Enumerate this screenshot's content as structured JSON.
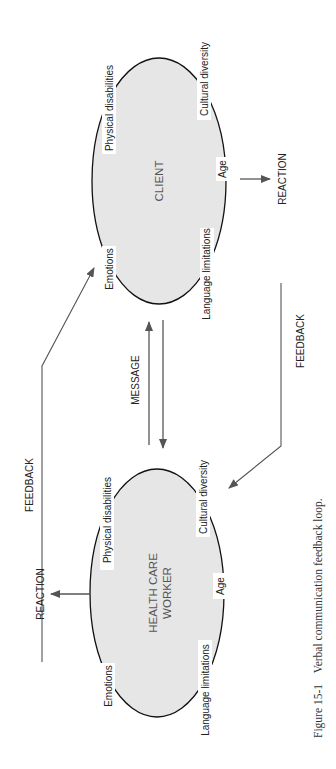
{
  "diagram": {
    "client": {
      "title": "CLIENT",
      "factors": {
        "physical": "Physical disabilities",
        "cultural": "Cultural diversity",
        "age": "Age",
        "emotions": "Emotions",
        "language": "Language limitations"
      }
    },
    "worker": {
      "title_line1": "HEALTH CARE",
      "title_line2": "WORKER",
      "factors": {
        "physical": "Physical disabilities",
        "cultural": "Cultural diversity",
        "age": "Age",
        "emotions": "Emotions",
        "language": "Language limitations"
      }
    },
    "message_label": "MESSAGE",
    "feedback_left_label": "FEEDBACK",
    "feedback_right_label": "FEEDBACK",
    "reaction_client_label": "REACTION",
    "reaction_worker_label": "REACTION",
    "colors": {
      "ellipse_fill": "#e6e6e6",
      "outline": "#111111",
      "arrow": "#555555"
    }
  },
  "caption": {
    "number": "Figure 15-1",
    "text": "Verbal communication feedback loop."
  }
}
